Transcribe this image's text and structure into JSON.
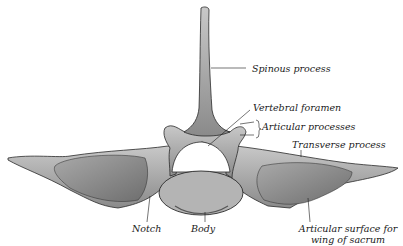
{
  "figure": {
    "colors": {
      "bone_light": "#bdbdbd",
      "bone_mid": "#8f8f8f",
      "bone_dark": "#5a5a5a",
      "outline": "#2a2a2a",
      "ink": "#1a1a1a"
    }
  },
  "labels": {
    "spinous_process": "Spinous process",
    "vertebral_foramen": "Vertebral foramen",
    "articular_processes": "Articular processes",
    "transverse_process": "Transverse process",
    "notch": "Notch",
    "body": "Body",
    "articular_surface_line1": "Articular surface for",
    "articular_surface_line2": "wing of sacrum"
  }
}
